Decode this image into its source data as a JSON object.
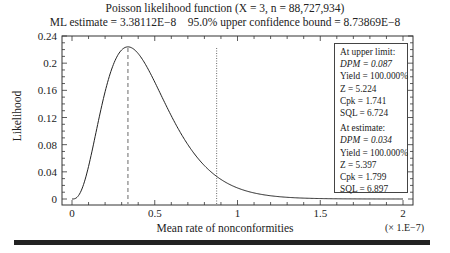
{
  "header": {
    "title": "Poisson likelihood function (X = 3, n = 88,727,934)",
    "subtitle": "ML estimate = 3.38112E−8    95.0% upper confidence bound = 8.73869E−8"
  },
  "axes": {
    "ylabel": "Likelihood",
    "xlabel": "Mean rate of nonconformities",
    "xscale": "(× 1.E−7)",
    "yticks": [
      "0",
      "0.04",
      "0.08",
      "0.12",
      "0.16",
      "0.2",
      "0.24"
    ],
    "xticks": [
      "0",
      "0.5",
      "1",
      "1.5",
      "2"
    ]
  },
  "infobox": {
    "upper_heading": "At upper limit:",
    "upper_dpm": "DPM = 0.087",
    "upper_yield": "Yield = 100.000%",
    "upper_z": "Z = 5.224",
    "upper_cpk": "Cpk = 1.741",
    "upper_sql": "SQL = 6.724",
    "est_heading": "At estimate:",
    "est_dpm": "DPM = 0.034",
    "est_yield": "Yield = 100.000%",
    "est_z": "Z = 5.397",
    "est_cpk": "Cpk = 1.799",
    "est_sql": "SQL = 6.897"
  },
  "chart_data": {
    "type": "line",
    "title": "Poisson likelihood function (X = 3, n = 88,727,934)",
    "subtitle": "ML estimate = 3.38112E-8    95.0% upper confidence bound = 8.73869E-8",
    "xlabel": "Mean rate of nonconformities (x 1.E-7)",
    "ylabel": "Likelihood",
    "xlim": [
      0,
      2
    ],
    "ylim": [
      0,
      0.24
    ],
    "grid": false,
    "series": [
      {
        "name": "Likelihood",
        "x": [
          0,
          0.05,
          0.1,
          0.15,
          0.2,
          0.25,
          0.3,
          0.338,
          0.4,
          0.5,
          0.6,
          0.7,
          0.8,
          0.874,
          1.0,
          1.2,
          1.4,
          1.6,
          1.8,
          2.0
        ],
        "y": [
          0,
          0.002,
          0.018,
          0.053,
          0.106,
          0.159,
          0.207,
          0.224,
          0.216,
          0.172,
          0.125,
          0.084,
          0.051,
          0.036,
          0.02,
          0.008,
          0.003,
          0.001,
          0.0004,
          0.0001
        ]
      }
    ],
    "annotations": [
      {
        "type": "vline",
        "x": 0.338,
        "style": "dashed",
        "label": "ML estimate"
      },
      {
        "type": "vline",
        "x": 0.874,
        "style": "dotted",
        "label": "95.0% upper confidence bound"
      }
    ]
  }
}
